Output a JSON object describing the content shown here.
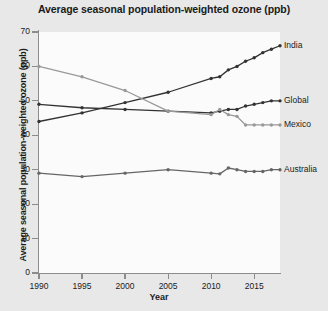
{
  "chart_data": {
    "type": "line",
    "title": "Average seasonal population-weighted ozone (ppb)",
    "xlabel": "Year",
    "ylabel": "Average seasonal population-weighted ozone (ppb)",
    "xlim": [
      1990,
      2018
    ],
    "ylim": [
      0,
      70
    ],
    "yticks": [
      0,
      10,
      20,
      30,
      40,
      50,
      60,
      70
    ],
    "xticks": [
      1990,
      1995,
      2000,
      2005,
      2010,
      2015
    ],
    "grid": false,
    "legend_position": "right-inline",
    "series": [
      {
        "name": "India",
        "color": "#333333",
        "x": [
          1990,
          1995,
          2000,
          2005,
          2010,
          2011,
          2012,
          2013,
          2014,
          2015,
          2016,
          2017,
          2018
        ],
        "values": [
          44.0,
          46.5,
          49.5,
          52.5,
          56.5,
          57.0,
          59.0,
          60.0,
          61.5,
          62.5,
          64.0,
          65.0,
          66.0
        ]
      },
      {
        "name": "Global",
        "color": "#333333",
        "x": [
          1990,
          1995,
          2000,
          2005,
          2010,
          2011,
          2012,
          2013,
          2014,
          2015,
          2016,
          2017,
          2018
        ],
        "values": [
          49.0,
          48.0,
          47.5,
          47.0,
          46.5,
          47.0,
          47.5,
          47.5,
          48.5,
          49.0,
          49.5,
          50.0,
          50.0
        ]
      },
      {
        "name": "Mexico",
        "color": "#999999",
        "x": [
          1990,
          1995,
          2000,
          2005,
          2010,
          2011,
          2012,
          2013,
          2014,
          2015,
          2016,
          2017,
          2018
        ],
        "values": [
          60.0,
          57.0,
          53.0,
          47.0,
          46.0,
          47.5,
          46.0,
          45.5,
          43.0,
          43.0,
          43.0,
          43.0,
          43.0
        ]
      },
      {
        "name": "Australia",
        "color": "#666666",
        "x": [
          1990,
          1995,
          2000,
          2005,
          2010,
          2011,
          2012,
          2013,
          2014,
          2015,
          2016,
          2017,
          2018
        ],
        "values": [
          29.0,
          28.0,
          29.0,
          30.0,
          29.0,
          28.8,
          30.5,
          30.0,
          29.5,
          29.5,
          29.5,
          30.0,
          30.0
        ]
      }
    ]
  },
  "axis": {
    "ytick_labels": [
      "0",
      "10",
      "20",
      "30",
      "40",
      "50",
      "60",
      "70"
    ],
    "xtick_labels": [
      "1990",
      "1995",
      "2000",
      "2005",
      "2010",
      "2015"
    ]
  },
  "labels": {
    "india": "India",
    "global": "Global",
    "mexico": "Mexico",
    "australia": "Australia"
  }
}
